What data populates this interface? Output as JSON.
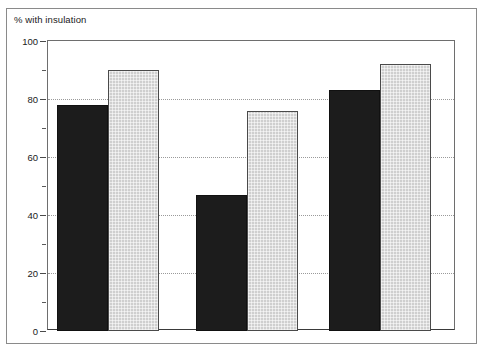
{
  "chart_data": {
    "type": "bar",
    "title": "% with insulation",
    "xlabel": "",
    "ylabel": "% with insulation",
    "ylim": [
      0,
      100
    ],
    "ytick_step": 20,
    "yminor_step": 10,
    "grid": true,
    "grid_axis": "y",
    "legend": "none",
    "categories": [
      "LA rented",
      "Private rented",
      "Owner-occupied"
    ],
    "series": [
      {
        "name": "series-1",
        "color": "#1c1c1c",
        "values": [
          78,
          47,
          83
        ]
      },
      {
        "name": "series-2",
        "color": "#cfcfcf",
        "values": [
          90,
          76,
          92
        ]
      }
    ],
    "ytick_labels": [
      "100",
      "80",
      "60",
      "40",
      "20",
      "0"
    ],
    "ytick_values": [
      100,
      80,
      60,
      40,
      20,
      0
    ]
  },
  "axes": {
    "y": {
      "ticks": [
        {
          "value": 100,
          "label": "100"
        },
        {
          "value": 90,
          "label": ""
        },
        {
          "value": 80,
          "label": "80"
        },
        {
          "value": 70,
          "label": ""
        },
        {
          "value": 60,
          "label": "60"
        },
        {
          "value": 50,
          "label": ""
        },
        {
          "value": 40,
          "label": "40"
        },
        {
          "value": 30,
          "label": ""
        },
        {
          "value": 20,
          "label": "20"
        },
        {
          "value": 10,
          "label": ""
        },
        {
          "value": 0,
          "label": "0"
        }
      ]
    }
  }
}
